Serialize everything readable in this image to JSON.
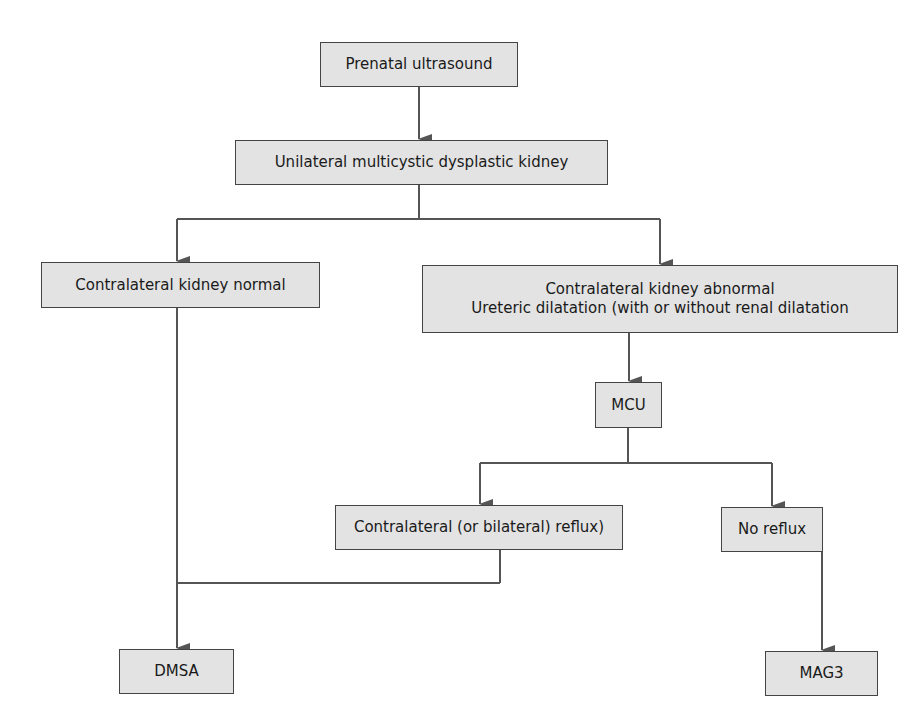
{
  "diagram": {
    "type": "flowchart",
    "colors": {
      "box_fill": "#e3e3e3",
      "box_border": "#444444",
      "connector": "#555555",
      "background": "#ffffff"
    },
    "nodes": {
      "prenatal": {
        "label": "Prenatal ultrasound"
      },
      "mcdk": {
        "label": "Unilateral multicystic dysplastic kidney"
      },
      "normal": {
        "label": "Contralateral kidney normal"
      },
      "abnormal": {
        "line1": "Contralateral kidney abnormal",
        "line2": "Ureteric dilatation (with or without renal dilatation"
      },
      "mcu": {
        "label": "MCU"
      },
      "reflux": {
        "label": "Contralateral (or bilateral) reflux)"
      },
      "no_reflux": {
        "label": "No reflux"
      },
      "dmsa": {
        "label": "DMSA"
      },
      "mag3": {
        "label": "MAG3"
      }
    },
    "edges": [
      [
        "prenatal",
        "mcdk"
      ],
      [
        "mcdk",
        "normal"
      ],
      [
        "mcdk",
        "abnormal"
      ],
      [
        "abnormal",
        "mcu"
      ],
      [
        "mcu",
        "reflux"
      ],
      [
        "mcu",
        "no_reflux"
      ],
      [
        "normal",
        "dmsa"
      ],
      [
        "reflux",
        "dmsa"
      ],
      [
        "no_reflux",
        "mag3"
      ]
    ]
  }
}
